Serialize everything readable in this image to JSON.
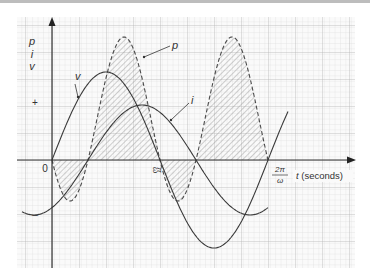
{
  "figure": {
    "type": "diagram",
    "title": "",
    "y_axis_labels": [
      "p",
      "i",
      "v"
    ],
    "sign_labels": {
      "positive": "+",
      "negative": "–"
    },
    "origin_label": "0",
    "x_ticks": [
      {
        "num": "π",
        "den": "ω"
      },
      {
        "num": "2π",
        "den": "ω"
      }
    ],
    "x_axis_label": "t (seconds)",
    "x_axis_var": "t",
    "x_axis_unit": "(seconds)",
    "curve_labels": {
      "voltage": "v",
      "current": "i",
      "power": "p"
    },
    "colors": {
      "grid_minor": "#d9d9d9",
      "grid_major": "#b8b8b8",
      "curve": "#3a3a3a",
      "hatch": "#8c8c8c",
      "axis": "#333333"
    }
  },
  "chart_data": {
    "type": "line",
    "title": "",
    "xlabel": "t (seconds)",
    "ylabel": "p, i, v",
    "x_ticks": [
      "0",
      "π/ω",
      "2π/ω"
    ],
    "series": [
      {
        "name": "v",
        "style": "solid",
        "form": "sin(ωt)",
        "relative_amplitude": 1.0
      },
      {
        "name": "i",
        "style": "solid",
        "form": "sin(ωt − φ)",
        "phase_lag_deg": 60,
        "relative_amplitude": 0.62
      },
      {
        "name": "p",
        "style": "dashed, hatched",
        "form": "v·i",
        "note": "positive lobes large, small negative lobes near zero crossings"
      }
    ],
    "legend": "inline labels with arrows",
    "grid": true
  }
}
